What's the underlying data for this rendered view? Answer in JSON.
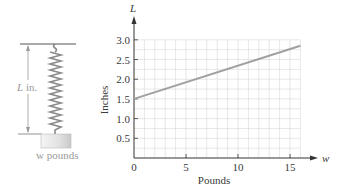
{
  "figure": {
    "spring": {
      "length_label": "L in.",
      "weight_label": "w pounds"
    }
  },
  "chart_data": {
    "type": "line",
    "title": "",
    "xlabel": "Pounds",
    "ylabel": "Inches",
    "x_axis_variable": "w",
    "y_axis_variable": "L",
    "xlim": [
      0,
      16
    ],
    "ylim": [
      0,
      3.0
    ],
    "x_ticks": [
      "0",
      "5",
      "10",
      "15"
    ],
    "y_ticks": [
      "0.5",
      "1.0",
      "1.5",
      "2.0",
      "2.5",
      "3.0"
    ],
    "grid": true,
    "series": [
      {
        "name": "L vs w",
        "x": [
          0,
          16
        ],
        "y": [
          1.5,
          2.85
        ],
        "color": "#a0a0a0"
      }
    ]
  }
}
